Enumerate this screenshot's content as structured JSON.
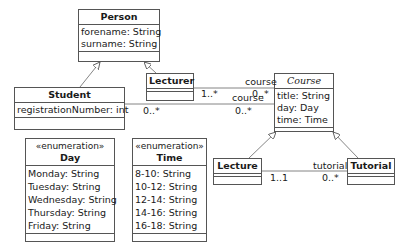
{
  "diagram": {
    "type": "UML class diagram",
    "classes": {
      "person": {
        "name": "Person",
        "attributes": [
          "forename: String",
          "surname: String"
        ]
      },
      "student": {
        "name": "Student",
        "attributes": [
          "registrationNumber: int"
        ]
      },
      "lecturer": {
        "name": "Lecturer",
        "attributes": []
      },
      "course": {
        "name": "Course",
        "abstract": true,
        "attributes": [
          "title: String",
          "day: Day",
          "time: Time"
        ]
      },
      "lecture": {
        "name": "Lecture",
        "attributes": []
      },
      "tutorial": {
        "name": "Tutorial",
        "attributes": []
      },
      "day": {
        "stereotype": "«enumeration»",
        "name": "Day",
        "attributes": [
          "Monday: String",
          "Tuesday: String",
          "Wednesday: String",
          "Thursday: String",
          "Friday: String"
        ]
      },
      "time": {
        "stereotype": "«enumeration»",
        "name": "Time",
        "attributes": [
          "8-10: String",
          "10-12: String",
          "12-14: String",
          "14-16: String",
          "16-18: String"
        ]
      }
    },
    "associations": {
      "lecturer_course": {
        "role": "course",
        "source_mult": "1..*",
        "target_mult": "0..*"
      },
      "student_course": {
        "role": "course",
        "source_mult": "0..*",
        "target_mult": "0..*"
      },
      "lecture_tutorial": {
        "role": "tutorial",
        "source_mult": "1..1",
        "target_mult": "0..*"
      }
    },
    "generalizations": [
      {
        "child": "Student",
        "parent": "Person"
      },
      {
        "child": "Lecturer",
        "parent": "Person"
      },
      {
        "child": "Lecture",
        "parent": "Course"
      },
      {
        "child": "Tutorial",
        "parent": "Course"
      }
    ]
  }
}
